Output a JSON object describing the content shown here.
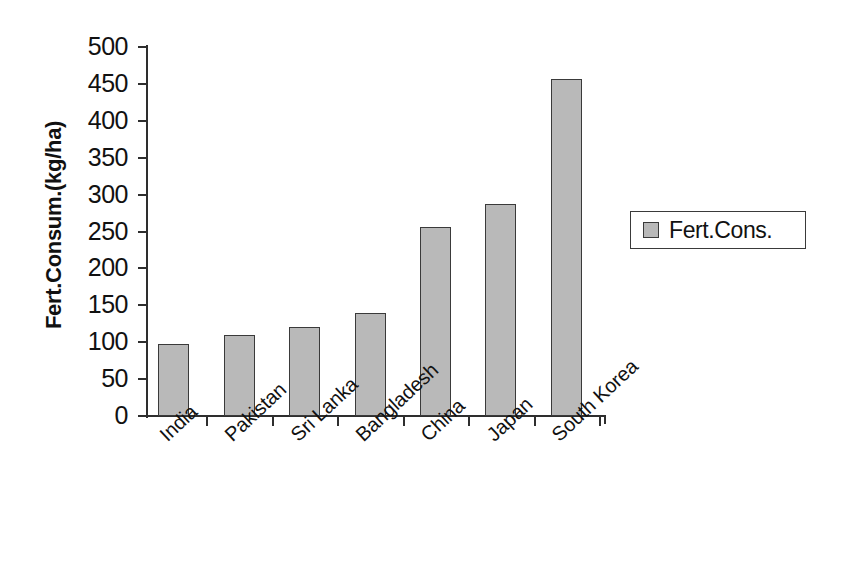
{
  "chart_data": {
    "type": "bar",
    "title": "",
    "subtitle": "",
    "xlabel": "",
    "ylabel": "Fert.Consum.(kg/ha)",
    "categories": [
      "India",
      "Pakistan",
      "Sri Lanka",
      "Bangladesh",
      "China",
      "Japan",
      "South Korea"
    ],
    "series": [
      {
        "name": "Fert.Cons.",
        "values": [
          97,
          110,
          120,
          140,
          256,
          287,
          456
        ]
      }
    ],
    "values": [
      97,
      110,
      120,
      140,
      256,
      287,
      456
    ],
    "ylim": [
      0,
      500
    ],
    "ytick_step": 50,
    "yticks": [
      0,
      50,
      100,
      150,
      200,
      250,
      300,
      350,
      400,
      450,
      500
    ],
    "ytick_labels": [
      "0",
      "50",
      "100",
      "150",
      "200",
      "250",
      "300",
      "350",
      "400",
      "450",
      "500"
    ],
    "grid": false,
    "legend": {
      "position": "right",
      "entries": [
        {
          "label": "Fert.Cons.",
          "swatch_color": "#b9b9b9"
        }
      ]
    },
    "xtick_label_rotation_deg": -43,
    "bar_color": "#b9b9b9",
    "bar_edge_color": "#3a3a3a",
    "axis_color": "#2e2e2e",
    "background_color": "#ffffff"
  }
}
